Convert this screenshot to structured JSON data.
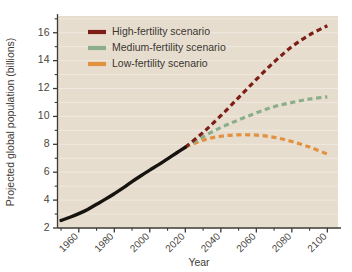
{
  "chart_data": {
    "type": "line",
    "title": "",
    "xlabel": "Year",
    "ylabel": "Projected global population (billions)",
    "xlim": [
      1948,
      2106
    ],
    "ylim": [
      2,
      17.2
    ],
    "grid": "horizontal",
    "legend_position": "top-left",
    "xticks": [
      1960,
      1980,
      2000,
      2020,
      2040,
      2060,
      2080,
      2100
    ],
    "xtick_labels": [
      "1960",
      "1980",
      "2000",
      "2020",
      "2040",
      "2060",
      "2080",
      "2100"
    ],
    "xticks_minor": [
      1950,
      1970,
      1990,
      2010,
      2030,
      2050,
      2070,
      2090
    ],
    "yticks": [
      2,
      4,
      6,
      8,
      10,
      12,
      14,
      16
    ],
    "ytick_labels": [
      "2",
      "4",
      "6",
      "8",
      "10",
      "12",
      "14",
      "16"
    ],
    "yticks_minor": [
      3,
      5,
      7,
      9,
      11,
      13,
      15,
      17
    ],
    "series": [
      {
        "name": "Historical",
        "style": "solid",
        "color": "#17140f",
        "x": [
          1950,
          1955,
          1960,
          1965,
          1970,
          1975,
          1980,
          1985,
          1990,
          1995,
          2000,
          2005,
          2010,
          2015,
          2020
        ],
        "values": [
          2.54,
          2.77,
          3.03,
          3.33,
          3.7,
          4.07,
          4.46,
          4.87,
          5.33,
          5.75,
          6.15,
          6.54,
          6.96,
          7.38,
          7.79
        ]
      },
      {
        "name": "High-fertility scenario",
        "style": "dashed",
        "color": "#7d1f16",
        "x": [
          2020,
          2030,
          2040,
          2050,
          2060,
          2070,
          2080,
          2090,
          2100
        ],
        "values": [
          7.79,
          8.85,
          10.05,
          11.35,
          12.65,
          13.9,
          15.0,
          15.85,
          16.5
        ]
      },
      {
        "name": "Medium-fertility scenario",
        "style": "dashed",
        "color": "#8bae8a",
        "x": [
          2020,
          2030,
          2040,
          2050,
          2060,
          2070,
          2080,
          2090,
          2100
        ],
        "values": [
          7.79,
          8.55,
          9.2,
          9.75,
          10.25,
          10.7,
          11.0,
          11.25,
          11.4
        ]
      },
      {
        "name": "Low-fertility scenario",
        "style": "dashed",
        "color": "#e2913f",
        "x": [
          2020,
          2030,
          2040,
          2050,
          2060,
          2070,
          2080,
          2090,
          2100
        ],
        "values": [
          7.79,
          8.3,
          8.58,
          8.68,
          8.66,
          8.5,
          8.2,
          7.8,
          7.3
        ]
      }
    ],
    "legend": [
      {
        "label": "High-fertility scenario",
        "color": "#7d1f16"
      },
      {
        "label": "Medium-fertility scenario",
        "color": "#8bae8a"
      },
      {
        "label": "Low-fertility scenario",
        "color": "#e2913f"
      }
    ],
    "colors": {
      "plot_background": "#e7ddcf",
      "page_background": "#ffffff",
      "axis": "#3d3a36",
      "gridline": "#f2ece2",
      "text": "#4a4641"
    }
  }
}
